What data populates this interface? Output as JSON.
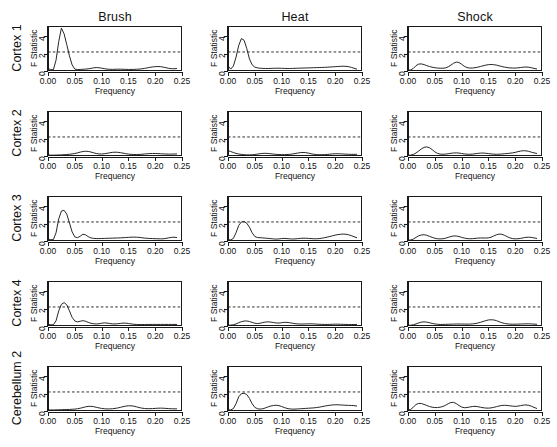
{
  "figure": {
    "columns": [
      "Brush",
      "Heat",
      "Shock"
    ],
    "rows": [
      "Cortex 1",
      "Cortex 2",
      "Cortex 3",
      "Cortex 4",
      "Cerebellum 2"
    ],
    "xlabel": "Frequency",
    "ylabel": "F Statistic",
    "xticks": [
      "0.00",
      "0.05",
      "0.10",
      "0.15",
      "0.20",
      "0.25"
    ],
    "yticks": [
      "0",
      "2",
      "4"
    ],
    "threshold_value": 2.2,
    "line_color": "#1a1a1a",
    "threshold_color": "#1a1a1a"
  },
  "chart_data": {
    "type": "line",
    "title": "",
    "xlabel": "Frequency",
    "ylabel": "F Statistic",
    "xlim": [
      0.0,
      0.25
    ],
    "ylim": [
      0.0,
      5.2
    ],
    "xticks": [
      0.0,
      0.05,
      0.1,
      0.15,
      0.2,
      0.25
    ],
    "yticks": [
      0,
      2,
      4
    ],
    "grid": false,
    "legend": "none",
    "annotations": [
      {
        "type": "hline",
        "y": 2.2,
        "style": "dashed",
        "label": "significance threshold"
      }
    ],
    "columns": [
      "Brush",
      "Heat",
      "Shock"
    ],
    "rows": [
      "Cortex 1",
      "Cortex 2",
      "Cortex 3",
      "Cortex 4",
      "Cerebellum 2"
    ],
    "x": [
      0.0,
      0.005,
      0.01,
      0.015,
      0.02,
      0.025,
      0.03,
      0.035,
      0.04,
      0.045,
      0.05,
      0.055,
      0.06,
      0.065,
      0.07,
      0.075,
      0.08,
      0.085,
      0.09,
      0.095,
      0.1,
      0.105,
      0.11,
      0.115,
      0.12,
      0.125,
      0.13,
      0.135,
      0.14,
      0.145,
      0.15,
      0.155,
      0.16,
      0.165,
      0.17,
      0.175,
      0.18,
      0.185,
      0.19,
      0.195,
      0.2,
      0.205,
      0.21,
      0.215,
      0.22,
      0.225,
      0.23,
      0.235,
      0.24
    ],
    "panels": [
      {
        "row": "Cortex 1",
        "column": "Brush",
        "peak_value": 5.0,
        "peak_frequency": 0.025,
        "crosses_threshold": true,
        "values": [
          0.3,
          0.16,
          0.14,
          1.25,
          3.4,
          4.95,
          4.3,
          3.05,
          1.75,
          0.7,
          0.22,
          0.17,
          0.18,
          0.2,
          0.22,
          0.25,
          0.3,
          0.36,
          0.4,
          0.38,
          0.33,
          0.27,
          0.22,
          0.2,
          0.19,
          0.2,
          0.21,
          0.21,
          0.2,
          0.19,
          0.18,
          0.18,
          0.19,
          0.2,
          0.22,
          0.25,
          0.3,
          0.36,
          0.42,
          0.47,
          0.5,
          0.52,
          0.5,
          0.45,
          0.38,
          0.31,
          0.27,
          0.26,
          0.28
        ]
      },
      {
        "row": "Cortex 1",
        "column": "Heat",
        "peak_value": 3.75,
        "peak_frequency": 0.025,
        "crosses_threshold": true,
        "values": [
          0.6,
          0.22,
          0.58,
          1.6,
          2.95,
          3.75,
          3.55,
          2.6,
          1.4,
          0.72,
          0.45,
          0.36,
          0.32,
          0.3,
          0.29,
          0.29,
          0.3,
          0.31,
          0.32,
          0.32,
          0.31,
          0.3,
          0.29,
          0.29,
          0.3,
          0.31,
          0.32,
          0.33,
          0.34,
          0.35,
          0.36,
          0.37,
          0.38,
          0.39,
          0.4,
          0.41,
          0.42,
          0.44,
          0.46,
          0.48,
          0.5,
          0.52,
          0.54,
          0.55,
          0.54,
          0.5,
          0.42,
          0.32,
          0.22
        ]
      },
      {
        "row": "Cortex 1",
        "column": "Shock",
        "peak_value": 1.05,
        "peak_frequency": 0.09,
        "crosses_threshold": false,
        "values": [
          0.1,
          0.12,
          0.3,
          0.62,
          0.8,
          0.82,
          0.74,
          0.62,
          0.52,
          0.44,
          0.38,
          0.34,
          0.32,
          0.32,
          0.36,
          0.48,
          0.68,
          0.9,
          1.03,
          0.98,
          0.78,
          0.55,
          0.4,
          0.34,
          0.34,
          0.38,
          0.44,
          0.52,
          0.6,
          0.68,
          0.73,
          0.75,
          0.73,
          0.68,
          0.6,
          0.52,
          0.45,
          0.4,
          0.36,
          0.34,
          0.34,
          0.36,
          0.4,
          0.44,
          0.46,
          0.44,
          0.38,
          0.3,
          0.24
        ]
      },
      {
        "row": "Cortex 2",
        "column": "Brush",
        "peak_value": 0.55,
        "peak_frequency": 0.07,
        "crosses_threshold": false,
        "values": [
          0.12,
          0.1,
          0.1,
          0.11,
          0.12,
          0.13,
          0.15,
          0.17,
          0.2,
          0.24,
          0.29,
          0.36,
          0.45,
          0.52,
          0.55,
          0.53,
          0.46,
          0.37,
          0.29,
          0.24,
          0.23,
          0.26,
          0.31,
          0.37,
          0.42,
          0.44,
          0.43,
          0.39,
          0.33,
          0.27,
          0.22,
          0.19,
          0.17,
          0.17,
          0.18,
          0.2,
          0.23,
          0.26,
          0.28,
          0.29,
          0.29,
          0.28,
          0.26,
          0.24,
          0.23,
          0.22,
          0.22,
          0.23,
          0.24
        ]
      },
      {
        "row": "Cortex 2",
        "column": "Heat",
        "peak_value": 0.62,
        "peak_frequency": 0.0,
        "crosses_threshold": false,
        "values": [
          0.62,
          0.52,
          0.4,
          0.3,
          0.23,
          0.18,
          0.15,
          0.13,
          0.13,
          0.14,
          0.17,
          0.22,
          0.27,
          0.3,
          0.31,
          0.29,
          0.26,
          0.22,
          0.19,
          0.17,
          0.16,
          0.16,
          0.17,
          0.19,
          0.23,
          0.28,
          0.34,
          0.39,
          0.41,
          0.39,
          0.33,
          0.26,
          0.2,
          0.17,
          0.15,
          0.15,
          0.16,
          0.18,
          0.21,
          0.24,
          0.26,
          0.26,
          0.25,
          0.23,
          0.21,
          0.2,
          0.19,
          0.19,
          0.2
        ]
      },
      {
        "row": "Cortex 2",
        "column": "Shock",
        "peak_value": 1.05,
        "peak_frequency": 0.032,
        "crosses_threshold": false,
        "values": [
          0.08,
          0.1,
          0.18,
          0.35,
          0.58,
          0.82,
          1.0,
          1.05,
          0.96,
          0.74,
          0.48,
          0.3,
          0.22,
          0.2,
          0.22,
          0.26,
          0.31,
          0.35,
          0.36,
          0.34,
          0.29,
          0.24,
          0.21,
          0.2,
          0.22,
          0.26,
          0.3,
          0.33,
          0.34,
          0.32,
          0.28,
          0.24,
          0.21,
          0.2,
          0.21,
          0.23,
          0.26,
          0.29,
          0.32,
          0.36,
          0.42,
          0.5,
          0.57,
          0.61,
          0.6,
          0.54,
          0.45,
          0.36,
          0.3
        ]
      },
      {
        "row": "Cortex 3",
        "column": "Brush",
        "peak_value": 3.55,
        "peak_frequency": 0.026,
        "crosses_threshold": true,
        "values": [
          0.22,
          0.16,
          0.15,
          0.95,
          2.55,
          3.45,
          3.55,
          3.1,
          2.1,
          1.05,
          0.48,
          0.38,
          0.55,
          0.78,
          0.72,
          0.5,
          0.36,
          0.3,
          0.28,
          0.28,
          0.29,
          0.3,
          0.31,
          0.32,
          0.33,
          0.34,
          0.35,
          0.36,
          0.38,
          0.4,
          0.42,
          0.44,
          0.45,
          0.44,
          0.42,
          0.38,
          0.34,
          0.31,
          0.29,
          0.28,
          0.27,
          0.26,
          0.25,
          0.26,
          0.3,
          0.36,
          0.42,
          0.44,
          0.4
        ]
      },
      {
        "row": "Cortex 3",
        "column": "Heat",
        "peak_value": 2.25,
        "peak_frequency": 0.027,
        "crosses_threshold": true,
        "values": [
          0.18,
          0.12,
          0.3,
          0.95,
          1.8,
          2.2,
          2.25,
          2.05,
          1.6,
          0.95,
          0.52,
          0.4,
          0.38,
          0.36,
          0.33,
          0.3,
          0.27,
          0.24,
          0.22,
          0.24,
          0.28,
          0.3,
          0.28,
          0.25,
          0.23,
          0.24,
          0.27,
          0.3,
          0.32,
          0.32,
          0.3,
          0.28,
          0.26,
          0.26,
          0.28,
          0.32,
          0.38,
          0.45,
          0.52,
          0.6,
          0.68,
          0.74,
          0.78,
          0.8,
          0.78,
          0.72,
          0.62,
          0.5,
          0.38
        ]
      },
      {
        "row": "Cortex 3",
        "column": "Shock",
        "peak_value": 0.82,
        "peak_frequency": 0.158,
        "crosses_threshold": false,
        "values": [
          0.1,
          0.12,
          0.22,
          0.42,
          0.6,
          0.7,
          0.72,
          0.66,
          0.54,
          0.42,
          0.32,
          0.26,
          0.24,
          0.26,
          0.32,
          0.42,
          0.52,
          0.58,
          0.58,
          0.52,
          0.42,
          0.34,
          0.28,
          0.26,
          0.27,
          0.3,
          0.33,
          0.35,
          0.35,
          0.34,
          0.36,
          0.44,
          0.58,
          0.72,
          0.8,
          0.78,
          0.66,
          0.5,
          0.36,
          0.28,
          0.25,
          0.26,
          0.3,
          0.36,
          0.42,
          0.44,
          0.42,
          0.36,
          0.3
        ]
      },
      {
        "row": "Cortex 4",
        "column": "Brush",
        "peak_value": 2.7,
        "peak_frequency": 0.028,
        "crosses_threshold": true,
        "values": [
          0.2,
          0.14,
          0.14,
          0.6,
          1.75,
          2.5,
          2.7,
          2.45,
          1.75,
          1.0,
          0.58,
          0.48,
          0.55,
          0.62,
          0.55,
          0.42,
          0.32,
          0.26,
          0.24,
          0.26,
          0.32,
          0.36,
          0.34,
          0.29,
          0.25,
          0.24,
          0.26,
          0.3,
          0.33,
          0.33,
          0.29,
          0.24,
          0.2,
          0.18,
          0.17,
          0.17,
          0.17,
          0.18,
          0.18,
          0.18,
          0.18,
          0.18,
          0.18,
          0.18,
          0.18,
          0.18,
          0.18,
          0.18,
          0.18
        ]
      },
      {
        "row": "Cortex 4",
        "column": "Heat",
        "peak_value": 0.58,
        "peak_frequency": 0.03,
        "crosses_threshold": false,
        "values": [
          0.1,
          0.1,
          0.14,
          0.24,
          0.38,
          0.5,
          0.57,
          0.58,
          0.52,
          0.42,
          0.32,
          0.28,
          0.32,
          0.4,
          0.46,
          0.48,
          0.45,
          0.4,
          0.35,
          0.34,
          0.38,
          0.42,
          0.42,
          0.38,
          0.32,
          0.27,
          0.24,
          0.23,
          0.23,
          0.24,
          0.25,
          0.25,
          0.24,
          0.22,
          0.2,
          0.19,
          0.18,
          0.18,
          0.19,
          0.2,
          0.21,
          0.21,
          0.2,
          0.19,
          0.18,
          0.17,
          0.17,
          0.17,
          0.18
        ]
      },
      {
        "row": "Cortex 4",
        "column": "Shock",
        "peak_value": 0.72,
        "peak_frequency": 0.158,
        "crosses_threshold": false,
        "values": [
          0.08,
          0.09,
          0.14,
          0.24,
          0.36,
          0.45,
          0.48,
          0.45,
          0.38,
          0.3,
          0.24,
          0.2,
          0.18,
          0.18,
          0.19,
          0.2,
          0.21,
          0.22,
          0.23,
          0.23,
          0.23,
          0.22,
          0.22,
          0.22,
          0.24,
          0.28,
          0.34,
          0.42,
          0.52,
          0.62,
          0.7,
          0.72,
          0.7,
          0.62,
          0.5,
          0.38,
          0.3,
          0.25,
          0.22,
          0.21,
          0.21,
          0.22,
          0.23,
          0.24,
          0.25,
          0.25,
          0.24,
          0.22,
          0.2
        ]
      },
      {
        "row": "Cerebellum 2",
        "column": "Brush",
        "peak_value": 0.6,
        "peak_frequency": 0.158,
        "crosses_threshold": false,
        "values": [
          0.14,
          0.12,
          0.12,
          0.13,
          0.14,
          0.15,
          0.16,
          0.17,
          0.18,
          0.2,
          0.22,
          0.26,
          0.32,
          0.4,
          0.48,
          0.53,
          0.54,
          0.5,
          0.43,
          0.36,
          0.3,
          0.26,
          0.24,
          0.24,
          0.26,
          0.3,
          0.35,
          0.42,
          0.5,
          0.56,
          0.6,
          0.6,
          0.56,
          0.48,
          0.4,
          0.33,
          0.29,
          0.27,
          0.27,
          0.28,
          0.3,
          0.32,
          0.33,
          0.32,
          0.3,
          0.28,
          0.26,
          0.25,
          0.25
        ]
      },
      {
        "row": "Cerebellum 2",
        "column": "Heat",
        "peak_value": 2.05,
        "peak_frequency": 0.028,
        "crosses_threshold": false,
        "values": [
          0.16,
          0.12,
          0.28,
          0.85,
          1.65,
          2.0,
          2.05,
          1.9,
          1.45,
          0.85,
          0.42,
          0.26,
          0.22,
          0.26,
          0.36,
          0.48,
          0.58,
          0.64,
          0.66,
          0.62,
          0.52,
          0.4,
          0.3,
          0.24,
          0.22,
          0.22,
          0.24,
          0.26,
          0.28,
          0.3,
          0.32,
          0.34,
          0.36,
          0.4,
          0.44,
          0.5,
          0.56,
          0.62,
          0.66,
          0.7,
          0.72,
          0.72,
          0.7,
          0.68,
          0.66,
          0.65,
          0.64,
          0.62,
          0.58
        ]
      },
      {
        "row": "Cerebellum 2",
        "column": "Shock",
        "peak_value": 1.0,
        "peak_frequency": 0.08,
        "crosses_threshold": false,
        "values": [
          0.12,
          0.18,
          0.45,
          0.75,
          0.88,
          0.86,
          0.76,
          0.64,
          0.52,
          0.44,
          0.4,
          0.4,
          0.44,
          0.52,
          0.66,
          0.84,
          0.98,
          1.0,
          0.86,
          0.64,
          0.46,
          0.38,
          0.4,
          0.46,
          0.52,
          0.54,
          0.5,
          0.44,
          0.38,
          0.34,
          0.33,
          0.36,
          0.42,
          0.5,
          0.58,
          0.64,
          0.66,
          0.64,
          0.6,
          0.56,
          0.54,
          0.56,
          0.62,
          0.68,
          0.7,
          0.66,
          0.56,
          0.42,
          0.3
        ]
      }
    ]
  }
}
